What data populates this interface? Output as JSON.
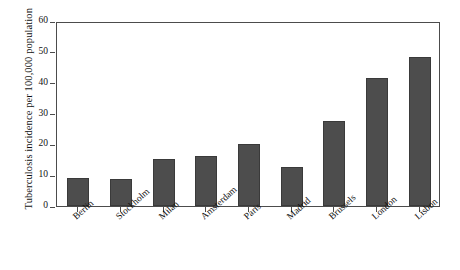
{
  "chart_data": {
    "type": "bar",
    "title": "",
    "xlabel": "",
    "ylabel": "Tuberculosis incidence per 100,000 population",
    "ylim": [
      0,
      60
    ],
    "yticks": [
      0,
      10,
      20,
      30,
      40,
      50,
      60
    ],
    "grid": false,
    "legend": null,
    "bar_color": "#4d4d4d",
    "axis_color": "#4c4c4c",
    "categories": [
      "Berlin",
      "Stockholm",
      "Milan",
      "Amsterdam",
      "Paris",
      "Madrid",
      "Brussels",
      "London",
      "Lisbon"
    ],
    "values": [
      9.0,
      8.7,
      15.3,
      16.3,
      20.0,
      12.7,
      27.5,
      41.5,
      48.3
    ]
  }
}
